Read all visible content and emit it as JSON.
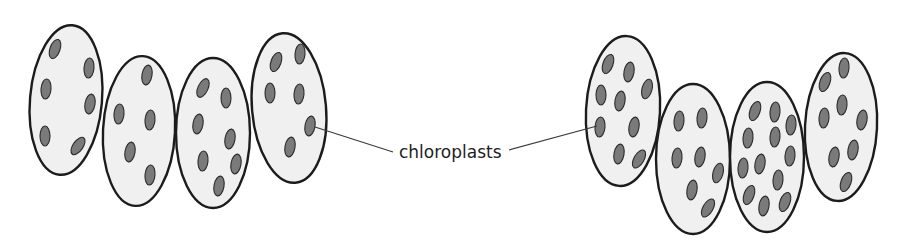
{
  "diagram": {
    "label": "chloroplasts",
    "colors": {
      "cell_fill": "#f0f0f0",
      "cell_outline": "#1c1c1c",
      "chloroplast_fill": "#7a7a7a"
    },
    "left_filament": {
      "cells": [
        {
          "cx": 66,
          "cy": 100,
          "rx": 36,
          "ry": 75,
          "rot": 5,
          "chloroplasts": [
            [
              55,
              49,
              -160
            ],
            [
              89,
              68,
              -175
            ],
            [
              46,
              89,
              -175
            ],
            [
              90,
              104,
              -170
            ],
            [
              45,
              136,
              180
            ],
            [
              78,
              146,
              -145
            ]
          ]
        },
        {
          "cx": 139,
          "cy": 131,
          "rx": 36,
          "ry": 75,
          "rot": 3,
          "chloroplasts": [
            [
              147,
              75,
              -170
            ],
            [
              119,
              114,
              -175
            ],
            [
              150,
              120,
              -175
            ],
            [
              130,
              152,
              -170
            ],
            [
              150,
              175,
              -175
            ]
          ]
        },
        {
          "cx": 213,
          "cy": 133,
          "rx": 37,
          "ry": 75,
          "rot": 0,
          "chloroplasts": [
            [
              203,
              88,
              -155
            ],
            [
              226,
              98,
              -180
            ],
            [
              198,
              124,
              -170
            ],
            [
              230,
              139,
              -170
            ],
            [
              203,
              161,
              -175
            ],
            [
              236,
              164,
              -170
            ],
            [
              219,
              186,
              -170
            ]
          ]
        },
        {
          "cx": 289,
          "cy": 108,
          "rx": 37,
          "ry": 75,
          "rot": -5,
          "chloroplasts": [
            [
              276,
              62,
              -160
            ],
            [
              300,
              54,
              -175
            ],
            [
              270,
              93,
              -180
            ],
            [
              299,
              94,
              -175
            ],
            [
              310,
              126,
              -170
            ],
            [
              290,
              147,
              -170
            ]
          ]
        }
      ]
    },
    "right_filament": {
      "cells": [
        {
          "cx": 623,
          "cy": 111,
          "rx": 37,
          "ry": 75,
          "rot": 3,
          "chloroplasts": [
            [
              608,
              64,
              -160
            ],
            [
              629,
              72,
              -170
            ],
            [
              647,
              89,
              -165
            ],
            [
              601,
              95,
              -180
            ],
            [
              620,
              101,
              -170
            ],
            [
              600,
              127,
              -175
            ],
            [
              634,
              127,
              -170
            ],
            [
              619,
              154,
              -170
            ],
            [
              639,
              159,
              -150
            ]
          ]
        },
        {
          "cx": 693,
          "cy": 159,
          "rx": 37,
          "ry": 75,
          "rot": 0,
          "chloroplasts": [
            [
              679,
              121,
              -175
            ],
            [
              702,
              118,
              -175
            ],
            [
              677,
              158,
              -175
            ],
            [
              700,
              157,
              -170
            ],
            [
              718,
              173,
              -165
            ],
            [
              692,
              190,
              -170
            ],
            [
              708,
              208,
              -150
            ]
          ]
        },
        {
          "cx": 767,
          "cy": 157,
          "rx": 37,
          "ry": 75,
          "rot": 0,
          "chloroplasts": [
            [
              755,
              111,
              -160
            ],
            [
              775,
              112,
              -175
            ],
            [
              791,
              125,
              -175
            ],
            [
              748,
              138,
              -175
            ],
            [
              775,
              137,
              -175
            ],
            [
              790,
              156,
              -175
            ],
            [
              743,
              168,
              -175
            ],
            [
              760,
              164,
              -170
            ],
            [
              778,
              180,
              -175
            ],
            [
              749,
              195,
              -160
            ],
            [
              764,
              206,
              -170
            ],
            [
              785,
              202,
              -160
            ]
          ]
        },
        {
          "cx": 841,
          "cy": 127,
          "rx": 36,
          "ry": 74,
          "rot": 3,
          "chloroplasts": [
            [
              825,
              82,
              -160
            ],
            [
              844,
              68,
              -175
            ],
            [
              824,
              118,
              -175
            ],
            [
              842,
              105,
              -175
            ],
            [
              862,
              120,
              -170
            ],
            [
              834,
              157,
              -170
            ],
            [
              853,
              150,
              -170
            ],
            [
              846,
              182,
              -160
            ]
          ]
        }
      ]
    },
    "leaders": {
      "left": {
        "x1": 315,
        "y1": 127,
        "x2": 393,
        "y2": 152
      },
      "right": {
        "x1": 509,
        "y1": 150,
        "x2": 597,
        "y2": 126
      }
    },
    "label_pos": {
      "x": 399,
      "y": 158
    }
  }
}
